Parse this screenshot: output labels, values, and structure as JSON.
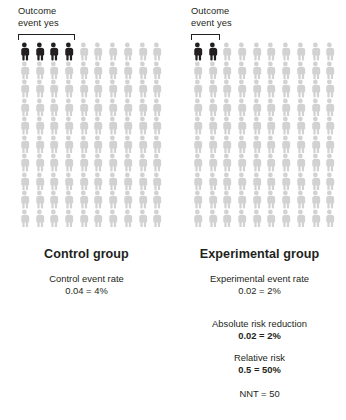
{
  "figure": {
    "type": "pictogram",
    "rows": 10,
    "columns": 10,
    "total_per_group": 100,
    "colors": {
      "event_person": "#231f20",
      "no_event_person": "#d2d2d2",
      "text": "#231f20"
    }
  },
  "chart_data": {
    "type": "pictogram",
    "title": "",
    "rows": 10,
    "columns": 10,
    "series": [
      {
        "name": "Control group",
        "total": 100,
        "events": 4,
        "non_events": 96,
        "event_rate": 0.04,
        "event_rate_percent": "4%"
      },
      {
        "name": "Experimental group",
        "total": 100,
        "events": 2,
        "non_events": 98,
        "event_rate": 0.02,
        "event_rate_percent": "2%"
      }
    ],
    "derived": {
      "absolute_risk_reduction": 0.02,
      "absolute_risk_reduction_percent": "2%",
      "relative_risk": 0.5,
      "relative_risk_percent": "50%",
      "nnt": 50
    }
  },
  "control": {
    "annotation": {
      "line1": "Outcome",
      "line2": "event yes",
      "bracket_span": 4
    },
    "events": 4,
    "total": 100,
    "heading": "Control group",
    "stats": [
      {
        "label": "Control event rate",
        "value": "0.04 = 4%",
        "bold_value": false
      }
    ]
  },
  "experimental": {
    "annotation": {
      "line1": "Outcome",
      "line2": "event yes",
      "bracket_span": 2
    },
    "events": 2,
    "total": 100,
    "heading": "Experimental group",
    "stats": [
      {
        "label": "Experimental event rate",
        "value": "0.02 = 2%",
        "bold_value": false
      },
      {
        "label": "Absolute risk reduction",
        "value": "0.02 = 2%",
        "bold_value": true
      },
      {
        "label": "Relative risk",
        "value": "0.5 = 50%",
        "bold_value": true
      },
      {
        "label": "",
        "value": "NNT = 50",
        "bold_value": false
      }
    ]
  }
}
